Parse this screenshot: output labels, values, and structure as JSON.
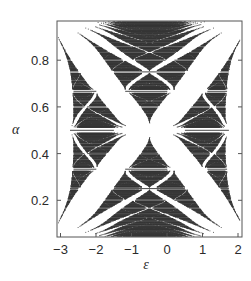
{
  "chart_data": {
    "type": "scatter",
    "title": "",
    "xlabel": "ε",
    "ylabel": "α",
    "xlim": [
      -3.2,
      2.15
    ],
    "ylim": [
      0.04,
      0.97
    ],
    "xticks": [
      -3,
      -2,
      -1,
      0,
      1,
      2
    ],
    "xtick_labels": [
      "−3",
      "−2",
      "−1",
      "0",
      "1",
      "2"
    ],
    "yticks": [
      0.2,
      0.4,
      0.6,
      0.8
    ],
    "ytick_labels": [
      "0.2",
      "0.4",
      "0.6",
      "0.8"
    ],
    "grid": false,
    "legend": null,
    "series": [
      {
        "name": "spectrum",
        "marker": "horizontal-dash",
        "color": "#333333",
        "model": "band edges of tight-binding chain with on-site term shifted, spectrum spans approx [-2-sqrt? , 2] ; upper gaps close toward alpha=1 at epsilon≈-2.2 and epsilon≈1.2",
        "q_max": 41
      }
    ],
    "annotations": []
  },
  "colors": {
    "ink": "#333333",
    "frame": "#555555",
    "background": "#ffffff"
  }
}
